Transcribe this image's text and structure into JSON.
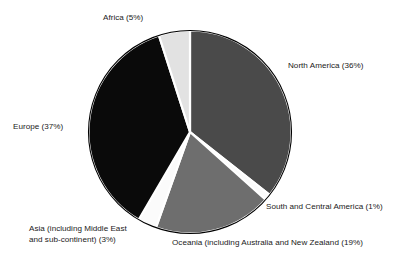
{
  "chart_data": {
    "type": "pie",
    "title": "",
    "subtitle": "",
    "xlabel": "",
    "ylabel": "",
    "legend_position": "none",
    "grid": false,
    "start_angle_deg": 0,
    "direction": "clockwise",
    "categories": [
      "North America",
      "South and Central America",
      "Oceania (including Australia and New Zealand",
      "Asia (including Middle East and sub-continent)",
      "Europe",
      "Africa"
    ],
    "values": [
      36,
      1,
      19,
      3,
      37,
      5
    ],
    "value_unit": "%",
    "colors": [
      "#4a4a4a",
      "#fbfbfb",
      "#6e6e6e",
      "#fbfbfb",
      "#0a0a0a",
      "#e2e2e2"
    ],
    "slices": [
      {
        "id": "north-america",
        "name": "North America",
        "value": 36,
        "color": "#4a4a4a",
        "label": "North America (36%)"
      },
      {
        "id": "south-central-america",
        "name": "South and Central America",
        "value": 1,
        "color": "#fbfbfb",
        "label": "South and Central America (1%)"
      },
      {
        "id": "oceania",
        "name": "Oceania (including Australia and New Zealand",
        "value": 19,
        "color": "#6e6e6e",
        "label": "Oceania (including Australia and New Zealand (19%)"
      },
      {
        "id": "asia",
        "name": "Asia (including Middle East and sub-continent)",
        "value": 3,
        "color": "#fbfbfb",
        "label": "Asia (including Middle East\nand sub-continent) (3%)"
      },
      {
        "id": "europe",
        "name": "Europe",
        "value": 37,
        "color": "#0a0a0a",
        "label": "Europe (37%)"
      },
      {
        "id": "africa",
        "name": "Africa",
        "value": 5,
        "color": "#e2e2e2",
        "label": "Africa (5%)"
      }
    ]
  },
  "labels": {
    "africa": "Africa (5%)",
    "north_america": "North America (36%)",
    "europe": "Europe (37%)",
    "south_central_america": "South and Central America (1%)",
    "oceania": "Oceania (including Australia and New Zealand (19%)",
    "asia_line1": "Asia (including Middle East",
    "asia_line2": "and sub-continent) (3%)"
  },
  "style": {
    "background": "#ffffff",
    "outline": "#000000",
    "separator": "#ffffff",
    "text": "#1a1a1a"
  }
}
